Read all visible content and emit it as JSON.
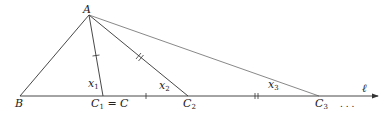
{
  "diagram": {
    "points": {
      "A": {
        "label": "A",
        "x": 89,
        "y": 15
      },
      "B": {
        "label": "B",
        "x": 20,
        "y": 96
      },
      "C1": {
        "label": "C",
        "sub": "1",
        "suffix": " = C",
        "x": 103,
        "y": 96
      },
      "C2": {
        "label": "C",
        "sub": "2",
        "x": 188,
        "y": 96
      },
      "C3": {
        "label": "C",
        "sub": "3",
        "x": 319,
        "y": 96
      }
    },
    "segments": [
      {
        "from": "A",
        "to": "B"
      },
      {
        "from": "A",
        "to": "C1",
        "label": "x",
        "sub": "1"
      },
      {
        "from": "A",
        "to": "C2",
        "label": "x",
        "sub": "2"
      },
      {
        "from": "A",
        "to": "C3",
        "label": "x",
        "sub": "3"
      }
    ],
    "line": {
      "label": "ℓ",
      "continuation": ". . ."
    }
  }
}
